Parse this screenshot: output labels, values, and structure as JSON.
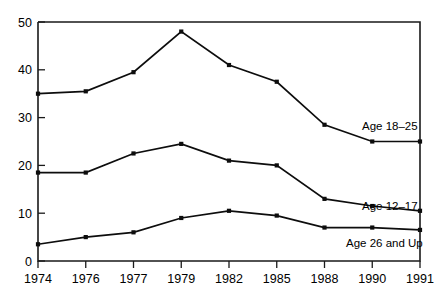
{
  "chart_data": {
    "type": "line",
    "title": "",
    "subtitle": "",
    "xlabel": "",
    "ylabel": "",
    "categories": [
      "1974",
      "1976",
      "1977",
      "1979",
      "1982",
      "1985",
      "1988",
      "1990",
      "1991"
    ],
    "x_tick_labels": [
      "1974",
      "1976",
      "1977",
      "1979",
      "1982",
      "1985",
      "1988",
      "1990",
      "1991"
    ],
    "y_tick_labels": [
      "0",
      "10",
      "20",
      "30",
      "40",
      "50"
    ],
    "y_ticks": [
      0,
      10,
      20,
      30,
      40,
      50
    ],
    "ylim": [
      0,
      50
    ],
    "grid": false,
    "legend_position": "inline-right",
    "series": [
      {
        "name": "Age 18-25",
        "label": "Age 18–25",
        "color": "#0d0d0d",
        "values": [
          35,
          35.5,
          39.5,
          48,
          41,
          37.5,
          28.5,
          25,
          25
        ]
      },
      {
        "name": "Age 12-17",
        "label": "Age 12–17",
        "color": "#0d0d0d",
        "values": [
          18.5,
          18.5,
          22.5,
          24.5,
          21,
          20,
          13,
          11.5,
          10.5
        ]
      },
      {
        "name": "Age 26 and Up",
        "label": "Age 26 and Up",
        "color": "#0d0d0d",
        "values": [
          3.5,
          5,
          6,
          9,
          10.5,
          9.5,
          7,
          7,
          6.5
        ]
      }
    ],
    "annotations": [
      {
        "text": "Age 18–25",
        "series": "Age 18-25",
        "x": 362,
        "y": 126
      },
      {
        "text": "Age 12–17",
        "series": "Age 12-17",
        "x": 362,
        "y": 206
      },
      {
        "text": "Age 26 and Up",
        "series": "Age 26 and Up",
        "x": 346,
        "y": 243
      }
    ]
  },
  "axes": {
    "plot_left": 38,
    "plot_right": 420,
    "plot_top": 22,
    "plot_bottom": 261,
    "x_step": 47.75
  }
}
